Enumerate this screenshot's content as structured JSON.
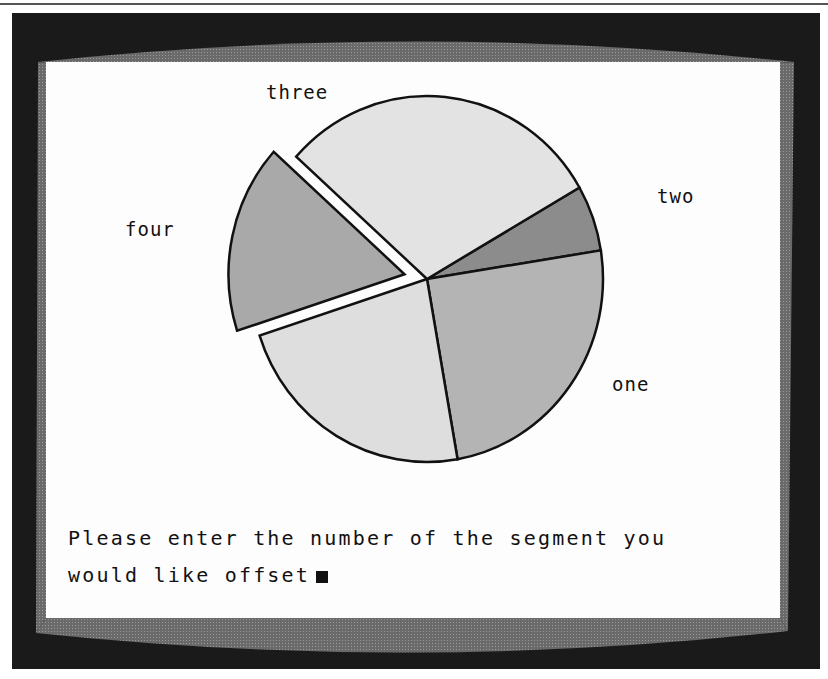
{
  "screen": {
    "prompt_line1": "Please enter the number of the segment you",
    "prompt_line2": "would like offset",
    "cursor": "block-cursor"
  },
  "chart_data": {
    "type": "pie",
    "title": "",
    "exploded_segment": "four",
    "center": [
      427,
      279
    ],
    "radius": [
      176,
      183
    ],
    "segments": [
      {
        "label": "two",
        "start_deg": -30,
        "end_deg": -9,
        "sweep_deg": 21,
        "fill": "#8c8c8c",
        "offset": 0
      },
      {
        "label": "one",
        "start_deg": -9,
        "end_deg": 80,
        "sweep_deg": 89,
        "fill": "#b4b4b4",
        "offset": 0
      },
      {
        "label": "",
        "start_deg": 80,
        "end_deg": 162,
        "sweep_deg": 82,
        "fill": "#dedede",
        "offset": 0
      },
      {
        "label": "four",
        "start_deg": 162,
        "end_deg": 222,
        "sweep_deg": 60,
        "fill": "#a9a9a9",
        "offset": 23
      },
      {
        "label": "three",
        "start_deg": 222,
        "end_deg": 330,
        "sweep_deg": 108,
        "fill": "#e3e3e3",
        "offset": 0
      }
    ],
    "labels": [
      {
        "text": "three",
        "x": 266,
        "y": 81
      },
      {
        "text": "two",
        "x": 657,
        "y": 185
      },
      {
        "text": "four",
        "x": 125,
        "y": 218
      },
      {
        "text": "one",
        "x": 612,
        "y": 373
      }
    ]
  }
}
